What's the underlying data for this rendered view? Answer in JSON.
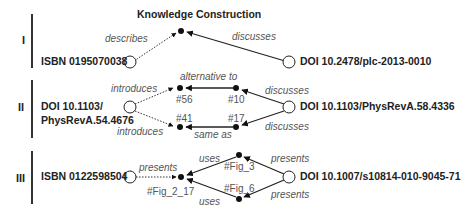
{
  "title": "Knowledge Construction",
  "sections": [
    {
      "numeral": "I",
      "source": "ISBN 0195070038",
      "target": "DOI 10.2478/plc-2013-0010",
      "edges": {
        "left": "describes",
        "right": "discusses"
      }
    },
    {
      "numeral": "II",
      "source_line1": "DOI 10.1103/",
      "source_line2": "PhysRevA.54.4676",
      "target": "DOI 10.1103/PhysRevA.58.4336",
      "edges": {
        "introduces_top": "introduces",
        "introduces_bottom": "introduces",
        "alternative": "alternative to",
        "same": "same as",
        "discusses_top": "discusses",
        "discusses_bottom": "discusses"
      },
      "nodes": {
        "n56": "#56",
        "n10": "#10",
        "n41": "#41",
        "n17": "#17"
      }
    },
    {
      "numeral": "III",
      "source": "ISBN 0122598504",
      "target": "DOI 10.1007/s10814-010-9045-71",
      "edges": {
        "presents_left": "presents",
        "uses_top": "uses",
        "uses_bottom": "uses",
        "presents_top": "presents",
        "presents_bottom": "presents"
      },
      "nodes": {
        "fig2": "#Fig_2_17",
        "fig3": "#Fig_3",
        "fig6": "#Fig_6"
      }
    }
  ]
}
